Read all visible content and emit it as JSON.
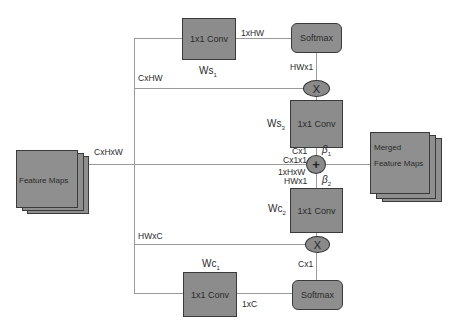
{
  "diagram": {
    "input": {
      "label": "Feature Maps",
      "dims": "CxHxW"
    },
    "output": {
      "label_line1": "Merged",
      "label_line2": "Feature Maps"
    },
    "spatial_branch": {
      "conv1": {
        "label": "1x1 Conv",
        "weight": "Ws",
        "weight_sub": "1"
      },
      "conv1_out_dims": "1xHW",
      "softmax": {
        "label": "Softmax"
      },
      "softmax_out_dims": "HWx1",
      "skip_dims": "CxHW",
      "multiply": {
        "symbol": "X"
      },
      "conv3": {
        "label": "1x1 Conv",
        "weight": "Ws",
        "weight_sub": "3"
      },
      "conv3_out_dims": "Cx1"
    },
    "fusion": {
      "symbol": "+",
      "beta1": {
        "symbol": "β",
        "sub": "1"
      },
      "beta2": {
        "symbol": "β",
        "sub": "2"
      },
      "dims_left_top": "Cx1x1",
      "dims_left_bottom": "1xHxW"
    },
    "channel_branch": {
      "conv2": {
        "label": "1x1 Conv",
        "weight": "Wc",
        "weight_sub": "2"
      },
      "conv2_in_dims": "HWx1",
      "multiply": {
        "symbol": "X"
      },
      "skip_dims": "HWxC",
      "softmax": {
        "label": "Softmax"
      },
      "softmax_out_dims": "Cx1",
      "conv1": {
        "label": "1x1 Conv",
        "weight": "Wc",
        "weight_sub": "1"
      },
      "conv1_out_dims": "1xC"
    }
  }
}
